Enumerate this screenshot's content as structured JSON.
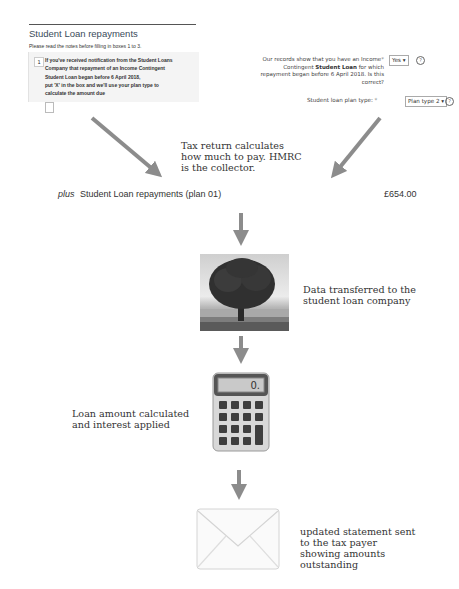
{
  "left_form": {
    "title": "Student Loan repayments",
    "subtitle": "Please read the notes before filling in boxes 1 to 3.",
    "question_number": "1",
    "question_lines": [
      "If you've received notification from the Student Loans",
      "Company that repayment of an Income Contingent",
      "Student Loan began before 6 April 2018,",
      "put 'X' in the box and we'll use your plan type to",
      "calculate the amount due"
    ],
    "checkbox_checked": false
  },
  "right_form": {
    "records_label_part1": "Our records show that you have an Income",
    "records_label_part2": "Contingent ",
    "records_label_bold": "Student Loan",
    "records_label_part3": " for which repayment began before 6 April 2018. Is this correct?",
    "required_marker": "*",
    "records_select_value": "Yes ▾",
    "plan_label": "Student loan plan type:",
    "plan_select_value": "Plan type 2 ▾",
    "help_icon_glyph": "?"
  },
  "captions": {
    "tax_return": "Tax return calculates how much to pay. HMRC is the collector.",
    "data_transfer": "Data transferred to the student loan company",
    "loan_calc": "Loan amount calculated and interest applied",
    "statement": "updated statement sent to the tax payer showing amounts outstanding"
  },
  "calculation_row": {
    "prefix": "plus",
    "label": "Student Loan repayments (plan 01)",
    "amount": "£654.00"
  },
  "calculator_display": "0.",
  "colors": {
    "arrow": "#8c8c8c",
    "form_title": "#3a4b5a",
    "text": "#333333"
  }
}
